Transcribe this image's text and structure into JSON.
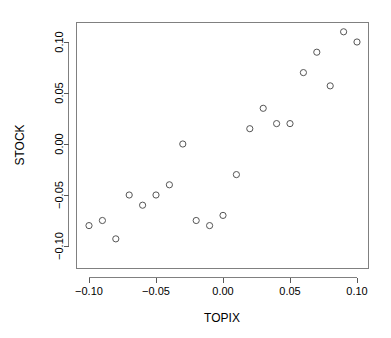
{
  "chart_data": {
    "type": "scatter",
    "title": "",
    "xlabel": "TOPIX",
    "ylabel": "STOCK",
    "xlim": [
      -0.108,
      0.113
    ],
    "ylim": [
      -0.105,
      0.118
    ],
    "xticks": [
      -0.1,
      -0.05,
      0.0,
      0.05,
      0.1
    ],
    "xtick_labels": [
      "-0.10",
      "-0.05",
      "0.00",
      "0.05",
      "0.10"
    ],
    "yticks": [
      -0.1,
      -0.05,
      0.0,
      0.05,
      0.1
    ],
    "ytick_labels": [
      "-0.10",
      "-0.05",
      "0.00",
      "0.05",
      "0.10"
    ],
    "grid": false,
    "legend": false,
    "marker": "open-circle",
    "marker_color": "#555555",
    "x": [
      -0.1,
      -0.09,
      -0.08,
      -0.07,
      -0.06,
      -0.05,
      -0.04,
      -0.03,
      -0.02,
      -0.01,
      0.0,
      0.01,
      0.02,
      0.03,
      0.04,
      0.05,
      0.06,
      0.07,
      0.08,
      0.09,
      0.1
    ],
    "y": [
      -0.08,
      -0.075,
      -0.093,
      -0.05,
      -0.06,
      -0.05,
      -0.04,
      0.0,
      -0.075,
      -0.08,
      -0.07,
      -0.03,
      0.015,
      0.035,
      0.02,
      0.02,
      0.07,
      0.09,
      0.057,
      0.11,
      0.1
    ],
    "points": [
      {
        "x": -0.1,
        "y": -0.08
      },
      {
        "x": -0.09,
        "y": -0.075
      },
      {
        "x": -0.08,
        "y": -0.093
      },
      {
        "x": -0.07,
        "y": -0.05
      },
      {
        "x": -0.06,
        "y": -0.06
      },
      {
        "x": -0.05,
        "y": -0.05
      },
      {
        "x": -0.04,
        "y": -0.04
      },
      {
        "x": -0.03,
        "y": 0.0
      },
      {
        "x": -0.02,
        "y": -0.075
      },
      {
        "x": -0.01,
        "y": -0.08
      },
      {
        "x": 0.0,
        "y": -0.07
      },
      {
        "x": 0.01,
        "y": -0.03
      },
      {
        "x": 0.02,
        "y": 0.015
      },
      {
        "x": 0.03,
        "y": 0.035
      },
      {
        "x": 0.04,
        "y": 0.02
      },
      {
        "x": 0.05,
        "y": 0.02
      },
      {
        "x": 0.06,
        "y": 0.07
      },
      {
        "x": 0.07,
        "y": 0.09
      },
      {
        "x": 0.08,
        "y": 0.057
      },
      {
        "x": 0.09,
        "y": 0.11
      },
      {
        "x": 0.1,
        "y": 0.1
      }
    ]
  }
}
